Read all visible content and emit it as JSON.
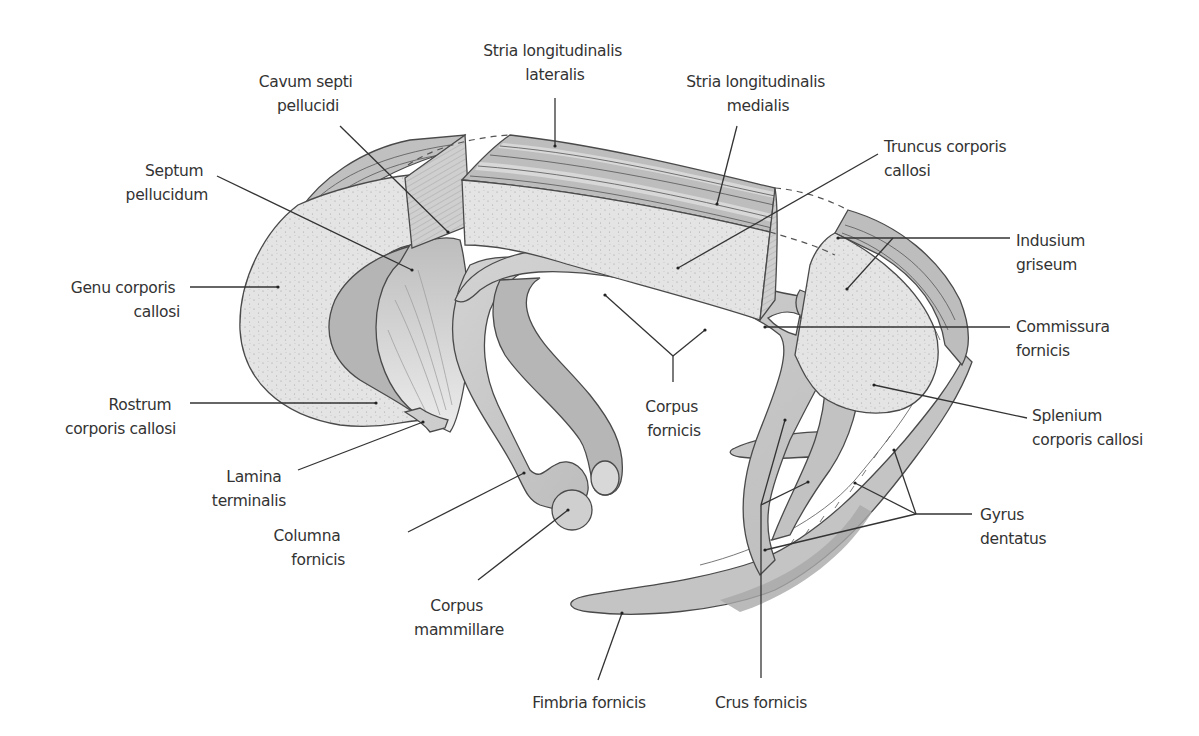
{
  "figure": {
    "colors": {
      "background": "#ffffff",
      "callosum_cut_surface": "#e4e4e4",
      "stria_band_dark": "#b8b8b8",
      "stria_band_light": "#d6d6d6",
      "fornix": "#c9c9c9",
      "fornix_dark": "#a9a9a9",
      "septum": "#d9d9d9",
      "outline": "#4a4a4a",
      "label_text": "#333333"
    }
  },
  "labels": {
    "stria_lateralis": {
      "line1": "Stria longitudinalis",
      "line2": "lateralis"
    },
    "cavum_septi": {
      "line1": "Cavum septi",
      "line2": "pellucidi"
    },
    "stria_medialis": {
      "line1": "Stria longitudinalis",
      "line2": "medialis"
    },
    "truncus": {
      "line1": "Truncus corporis",
      "line2": "callosi"
    },
    "septum": {
      "line1": "Septum",
      "line2": "pellucidum"
    },
    "indusium": {
      "line1": "Indusium",
      "line2": "griseum"
    },
    "genu": {
      "line1": "Genu corporis",
      "line2": "callosi"
    },
    "commissura": {
      "line1": "Commissura",
      "line2": "fornicis"
    },
    "corpus_fornicis": {
      "line1": "Corpus",
      "line2": "fornicis"
    },
    "rostrum": {
      "line1": "Rostrum",
      "line2": "corporis callosi"
    },
    "splenium": {
      "line1": "Splenium",
      "line2": "corporis callosi"
    },
    "lamina": {
      "line1": "Lamina",
      "line2": "terminalis"
    },
    "gyrus_dentatus": {
      "line1": "Gyrus",
      "line2": "dentatus"
    },
    "columna": {
      "line1": "Columna",
      "line2": "fornicis"
    },
    "corpus_mammillare": {
      "line1": "Corpus",
      "line2": "mammillare"
    },
    "fimbria": {
      "line1": "Fimbria fornicis"
    },
    "crus": {
      "line1": "Crus fornicis"
    }
  }
}
